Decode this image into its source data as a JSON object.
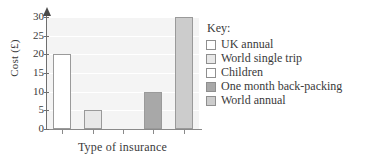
{
  "chart_data": {
    "type": "bar",
    "title": "",
    "xlabel": "Type of insurance",
    "ylabel": "Cost (£)",
    "categories": [
      "UK annual",
      "World single trip",
      "Children",
      "One month back-packing",
      "World annual"
    ],
    "values": [
      20,
      5,
      0,
      10,
      30
    ],
    "ylim": [
      0,
      30
    ],
    "yticks": [
      0,
      5,
      10,
      15,
      20,
      25,
      30
    ],
    "ytick_labels": [
      "0",
      "5",
      "10",
      "15",
      "20",
      "25",
      "30"
    ],
    "grid": true,
    "legend_position": "right",
    "colors": [
      "#ffffff",
      "#e8e8e8",
      "#ffffff",
      "#a8a8a8",
      "#cccccc"
    ],
    "bar_border_color": "#9a9a9a",
    "plot_background": "#f4f4f4",
    "axis_color": "#6f6f6f"
  },
  "legend": {
    "title": "Key:",
    "items": [
      {
        "label": "UK annual",
        "color": "#ffffff"
      },
      {
        "label": "World single trip",
        "color": "#e8e8e8"
      },
      {
        "label": "Children",
        "color": "#ffffff"
      },
      {
        "label": "One month back-packing",
        "color": "#a8a8a8"
      },
      {
        "label": "World annual",
        "color": "#cccccc"
      }
    ]
  }
}
